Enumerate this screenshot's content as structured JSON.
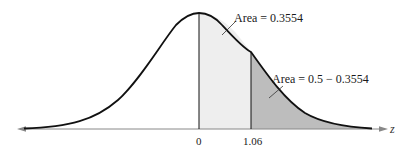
{
  "figure": {
    "type": "normal-distribution-curve",
    "axis_variable": "z",
    "annotations": [
      {
        "label": "Area = 0.3554",
        "region": "between 0 and 1.06"
      },
      {
        "label": "Area = 0.5 − 0.3554",
        "region": "right of 1.06"
      }
    ],
    "ticks": [
      {
        "label": "0",
        "value": 0
      },
      {
        "label": "1.06",
        "value": 1.06
      }
    ],
    "colors": {
      "curve": "#111111",
      "center_region_fill": "#eeeeee",
      "tail_region_fill": "#bdbdbd",
      "axis": "#888888"
    }
  }
}
